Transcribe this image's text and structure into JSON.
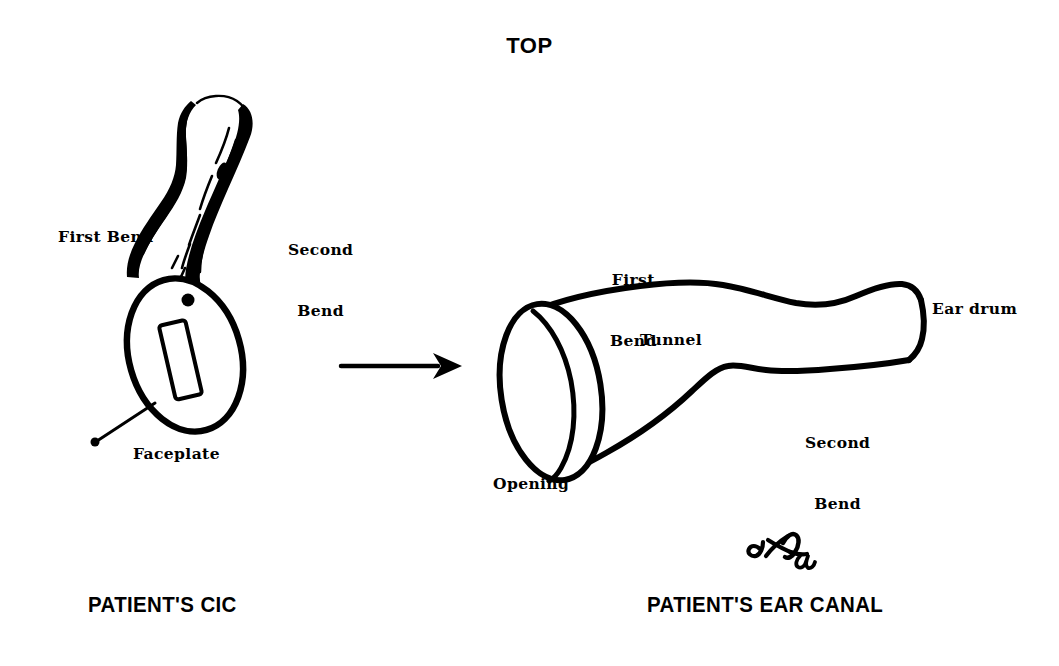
{
  "page": {
    "background_color": "#ffffff",
    "ink_color": "#000000",
    "width": 1059,
    "height": 666,
    "orientation_title": "TOP"
  },
  "title": {
    "text": "TOP"
  },
  "left_figure": {
    "caption": "PATIENT'S CIC",
    "subject": "completely-in-the-canal hearing aid shell",
    "labels": {
      "first_bend": "First Bend",
      "second_bend_line1": "Second",
      "second_bend_line2": "Bend",
      "faceplate": "Faceplate"
    },
    "parts": [
      "faceplate-oval",
      "battery-door-slot",
      "microphone-port-dot",
      "canal-shell-body",
      "leader-line-to-faceplate"
    ]
  },
  "middle": {
    "arrow": {
      "name": "transformation-arrow",
      "direction": "left-to-right",
      "from_label": "PATIENT'S CIC",
      "to_label": "PATIENT'S EAR CANAL"
    }
  },
  "right_figure": {
    "caption": "PATIENT'S EAR CANAL",
    "subject": "ear canal tunnel cut-away",
    "labels": {
      "first_bend_line1": "First",
      "first_bend_line2": "Bend",
      "tunnel": "Tunnel",
      "second_bend_line1": "Second",
      "second_bend_line2": "Bend",
      "ear_drum": "Ear drum",
      "opening": "Opening"
    },
    "parts": [
      "canal-opening-ellipse",
      "canal-tunnel-outline",
      "ear-drum-end"
    ]
  },
  "annotation": {
    "signature_mark": "handwritten initials and date 96",
    "description": "small hand-drawn signature scribble"
  }
}
